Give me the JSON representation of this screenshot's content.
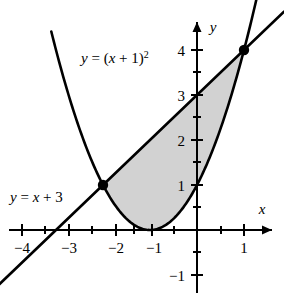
{
  "figure": {
    "background_color": "#ffffff",
    "stroke_color": "#000000",
    "shade_color": "#d2d2d2",
    "axis_labels": {
      "x": "x",
      "y": "y"
    },
    "curve_labels": {
      "parabola": {
        "full_text": "y = (x + 1)²",
        "lhs": "y",
        "equals": " = (",
        "var": "x",
        "plus_one": " + 1)",
        "exponent": "2"
      },
      "line": {
        "full_text": "y = x + 3",
        "lhs": "y",
        "equals": " = ",
        "var": "x",
        "rest": " + 3"
      }
    },
    "x_tick_labels": [
      "−4",
      "−3",
      "−2",
      "−1",
      "1"
    ],
    "y_tick_labels": [
      "4",
      "3",
      "2",
      "1",
      "−1"
    ]
  },
  "chart_data": {
    "type": "line",
    "title": "",
    "xlabel": "x",
    "ylabel": "y",
    "xlim": [
      -4.6,
      1.85
    ],
    "ylim": [
      -1.5,
      4.6
    ],
    "grid": false,
    "legend": "none",
    "x_ticks_major": [
      -4,
      -3,
      -2,
      -1,
      1
    ],
    "x_ticks_minor": [
      -3.5,
      -2.5,
      -1.5,
      -0.5,
      0.5
    ],
    "y_ticks_major": [
      4,
      3,
      2,
      1,
      -1
    ],
    "y_ticks_minor": [
      3.5,
      2.5,
      1.5,
      0.5,
      -0.5
    ],
    "series": [
      {
        "name": "y = (x + 1)²",
        "type": "parabola",
        "equation": "y = (x + 1)^2",
        "vertex": [
          -1,
          0
        ],
        "domain": [
          -3.1,
          1.35
        ],
        "label_position": [
          -2.6,
          3.8
        ]
      },
      {
        "name": "y = x + 3",
        "type": "line",
        "equation": "y = x + 3",
        "slope": 1,
        "intercept": 3,
        "domain": [
          -4.35,
          1.85
        ],
        "label_position": [
          -4.4,
          1.0
        ]
      }
    ],
    "annotations": [
      {
        "kind": "intersection-point",
        "x": -2,
        "y": 1,
        "marker": "filled-circle"
      },
      {
        "kind": "intersection-point",
        "x": 1,
        "y": 4,
        "marker": "filled-circle"
      },
      {
        "kind": "shaded-region",
        "description": "region between line y = x + 3 (upper) and parabola y = (x + 1)² (lower)",
        "x_from": -2,
        "x_to": 1,
        "color": "#d2d2d2"
      }
    ]
  }
}
